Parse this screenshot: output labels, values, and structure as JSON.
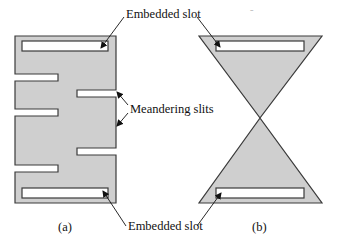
{
  "figure": {
    "labels": {
      "top_slot": "Embedded slot",
      "slits": "Meandering slits",
      "bottom_slot": "Embedded slot"
    },
    "captions": {
      "a": "(a)",
      "b": "(b)"
    }
  },
  "colors": {
    "fill": "#cfcfcf",
    "stroke": "#3a3a3a",
    "slot": "#ffffff",
    "text": "#111111"
  }
}
